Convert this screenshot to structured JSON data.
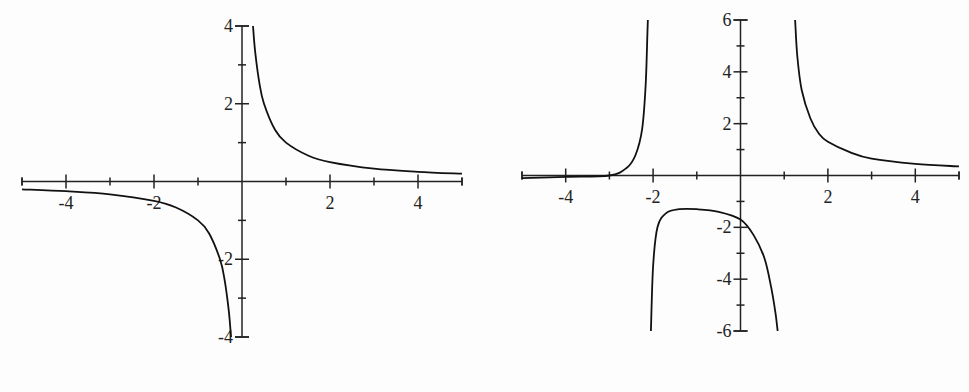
{
  "chart_data": [
    {
      "type": "line",
      "title": "",
      "xlabel": "",
      "ylabel": "",
      "xlim": [
        -5,
        5
      ],
      "ylim": [
        -4,
        4
      ],
      "grid": false,
      "x_ticks": [
        -4,
        -2,
        2,
        4
      ],
      "x_tick_labels": [
        "-4",
        "-2",
        "2",
        "4"
      ],
      "y_ticks": [
        4,
        2,
        -2,
        -4
      ],
      "y_tick_labels": [
        "4",
        "2",
        "-2",
        "-4"
      ],
      "vertical_asymptotes": [
        0
      ],
      "horizontal_asymptote": 0,
      "series": [
        {
          "name": "branch-left",
          "x": [
            -5,
            -4,
            -3,
            -2,
            -1.5,
            -1,
            -0.75,
            -0.5,
            -0.4,
            -0.3,
            -0.25
          ],
          "y": [
            -0.2,
            -0.25,
            -0.33,
            -0.5,
            -0.67,
            -1,
            -1.33,
            -2,
            -2.5,
            -3.33,
            -4
          ]
        },
        {
          "name": "branch-right",
          "x": [
            0.25,
            0.3,
            0.4,
            0.5,
            0.75,
            1,
            1.5,
            2,
            3,
            4,
            5
          ],
          "y": [
            4,
            3.33,
            2.5,
            2,
            1.33,
            1,
            0.67,
            0.5,
            0.33,
            0.25,
            0.2
          ]
        }
      ]
    },
    {
      "type": "line",
      "title": "",
      "xlabel": "",
      "ylabel": "",
      "xlim": [
        -5,
        5
      ],
      "ylim": [
        -6,
        6
      ],
      "grid": false,
      "x_ticks": [
        -4,
        -2,
        2,
        4
      ],
      "x_tick_labels": [
        "-4",
        "-2",
        "2",
        "4"
      ],
      "y_ticks": [
        6,
        4,
        2,
        -2,
        -4,
        -6
      ],
      "y_tick_labels": [
        "6",
        "4",
        "2",
        "-2",
        "-4",
        "-6"
      ],
      "vertical_asymptotes": [
        -2.1,
        1.2
      ],
      "horizontal_asymptote": 0,
      "series": [
        {
          "name": "branch-left",
          "x": [
            -5,
            -4,
            -3,
            -2.6,
            -2.4,
            -2.25,
            -2.17,
            -2.13,
            -2.12
          ],
          "y": [
            -0.1,
            -0.05,
            0,
            0.3,
            0.8,
            1.8,
            3.5,
            5.5,
            6
          ]
        },
        {
          "name": "branch-middle",
          "x": [
            -2.05,
            -2.0,
            -1.9,
            -1.7,
            -1.4,
            -1.0,
            -0.5,
            0,
            0.3,
            0.55,
            0.7,
            0.8,
            0.85
          ],
          "y": [
            -6,
            -3.5,
            -2.0,
            -1.45,
            -1.3,
            -1.3,
            -1.4,
            -1.7,
            -2.3,
            -3.2,
            -4.3,
            -5.3,
            -6
          ]
        },
        {
          "name": "branch-right",
          "x": [
            1.25,
            1.3,
            1.4,
            1.6,
            1.8,
            2,
            2.5,
            3,
            4,
            5
          ],
          "y": [
            6,
            4.6,
            3.3,
            2.2,
            1.6,
            1.3,
            0.9,
            0.65,
            0.45,
            0.35
          ]
        }
      ]
    }
  ]
}
